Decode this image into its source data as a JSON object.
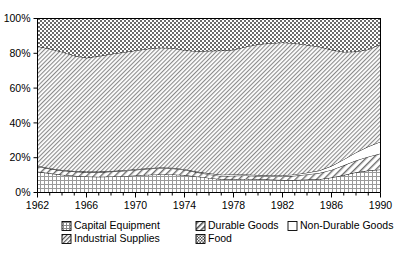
{
  "chart_data": {
    "type": "area",
    "stacked": true,
    "normalized_percent": true,
    "title": "",
    "subtitle": "",
    "xlabel": "",
    "ylabel": "",
    "xlim": [
      1962,
      1990
    ],
    "ylim": [
      0,
      100
    ],
    "grid": false,
    "legend_position": "bottom",
    "y_ticks": [
      "0%",
      "20%",
      "40%",
      "60%",
      "80%",
      "100%"
    ],
    "y_tick_values": [
      0,
      20,
      40,
      60,
      80,
      100
    ],
    "x_ticks": [
      "1962",
      "1966",
      "1970",
      "1974",
      "1978",
      "1982",
      "1986",
      "1990"
    ],
    "x_tick_values": [
      1962,
      1966,
      1970,
      1974,
      1978,
      1982,
      1986,
      1990
    ],
    "x_minor_tick_step": 1,
    "x": [
      1962,
      1963,
      1964,
      1965,
      1966,
      1967,
      1968,
      1969,
      1970,
      1971,
      1972,
      1973,
      1974,
      1975,
      1976,
      1977,
      1978,
      1979,
      1980,
      1981,
      1982,
      1983,
      1984,
      1985,
      1986,
      1987,
      1988,
      1989,
      1990
    ],
    "series": [
      {
        "name": "Capital Equipment",
        "pattern": "fine-dotted-grid",
        "stack_order": 1,
        "values": [
          12.0,
          11.0,
          10.2,
          9.6,
          9.2,
          9.0,
          9.2,
          9.4,
          9.8,
          10.2,
          10.4,
          10.4,
          10.0,
          9.2,
          8.4,
          7.6,
          7.6,
          7.8,
          7.6,
          7.4,
          7.2,
          7.2,
          7.4,
          7.6,
          8.6,
          10.0,
          11.6,
          12.6,
          13.2
        ]
      },
      {
        "name": "Durable Goods",
        "pattern": "diagonal-hatch",
        "stack_order": 2,
        "values": [
          3.0,
          2.6,
          2.4,
          2.4,
          2.4,
          2.6,
          2.8,
          3.0,
          3.2,
          3.4,
          3.6,
          3.4,
          3.0,
          2.4,
          2.0,
          1.8,
          2.0,
          2.0,
          1.8,
          1.8,
          2.0,
          2.4,
          3.0,
          3.6,
          4.4,
          5.6,
          6.8,
          8.0,
          9.2
        ]
      },
      {
        "name": "Non-Durable Goods",
        "pattern": "solid-white",
        "stack_order": 3,
        "values": [
          0.4,
          0.4,
          0.4,
          0.4,
          0.4,
          0.4,
          0.4,
          0.4,
          0.4,
          0.4,
          0.4,
          0.4,
          0.4,
          0.4,
          0.6,
          0.8,
          0.8,
          0.6,
          0.6,
          0.6,
          0.6,
          0.8,
          1.0,
          1.4,
          2.2,
          3.4,
          4.6,
          5.8,
          6.8
        ]
      },
      {
        "name": "Industrial Supplies",
        "pattern": "dense-diagonal-hatch",
        "stack_order": 4,
        "values": [
          68.6,
          68.6,
          67.8,
          66.2,
          65.4,
          66.4,
          67.2,
          67.8,
          68.2,
          68.6,
          68.8,
          68.8,
          68.4,
          69.2,
          70.4,
          71.4,
          71.6,
          73.4,
          75.2,
          76.0,
          76.4,
          75.4,
          73.4,
          71.2,
          66.8,
          61.8,
          58.0,
          55.8,
          56.0
        ]
      },
      {
        "name": "Food",
        "pattern": "checkerboard",
        "stack_order": 5,
        "values": [
          16.0,
          17.4,
          19.2,
          21.4,
          22.6,
          21.6,
          20.4,
          19.4,
          18.4,
          17.4,
          16.8,
          17.0,
          18.2,
          18.8,
          18.6,
          18.4,
          18.0,
          16.2,
          14.8,
          14.2,
          13.8,
          14.2,
          15.2,
          16.2,
          18.0,
          19.2,
          19.0,
          17.8,
          14.8
        ]
      }
    ],
    "legend": [
      {
        "label": "Capital Equipment",
        "pattern": "fine-dotted-grid"
      },
      {
        "label": "Durable Goods",
        "pattern": "diagonal-hatch"
      },
      {
        "label": "Non-Durable Goods",
        "pattern": "solid-white"
      },
      {
        "label": "Industrial Supplies",
        "pattern": "dense-diagonal-hatch"
      },
      {
        "label": "Food",
        "pattern": "checkerboard"
      }
    ],
    "colors": {
      "axis": "#000000",
      "text": "#000000",
      "background": "#ffffff",
      "pattern_ink": "#444444"
    }
  }
}
